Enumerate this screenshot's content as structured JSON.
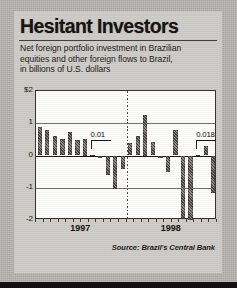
{
  "headline": "Hesitant Investors",
  "deck": [
    "Net foreign portfolio investment in Brazilian",
    "equities and other foreign flows to Brazil,",
    "in billions of U.S. dollars"
  ],
  "source": "Source: Brazil's Central Bank",
  "chart_data": {
    "type": "bar",
    "title": "Hesitant Investors",
    "subtitle": "Net foreign portfolio investment in Brazilian equities and other foreign flows to Brazil, in billions of U.S. dollars",
    "xlabel": "",
    "ylabel": "billions of U.S. dollars",
    "ylim": [
      -2,
      2
    ],
    "ytick_labels": [
      "$2",
      "1",
      "0",
      "-1",
      "-2"
    ],
    "ytick_values": [
      2,
      1,
      0,
      -1,
      -2
    ],
    "grid": true,
    "legend": false,
    "year_labels": [
      "1997",
      "1998"
    ],
    "categories": [
      "1997-01",
      "1997-02",
      "1997-03",
      "1997-04",
      "1997-05",
      "1997-06",
      "1997-07",
      "1997-08",
      "1997-09",
      "1997-10",
      "1997-11",
      "1997-12",
      "1998-01",
      "1998-02",
      "1998-03",
      "1998-04",
      "1998-05",
      "1998-06",
      "1998-07",
      "1998-08",
      "1998-09",
      "1998-10",
      "1998-11",
      "1998-12"
    ],
    "values": [
      0.88,
      0.78,
      0.6,
      0.52,
      0.73,
      0.48,
      0.5,
      0.01,
      -0.08,
      -0.6,
      -1.05,
      -0.42,
      0.38,
      0.62,
      1.25,
      0.42,
      -0.09,
      -0.52,
      0.8,
      -1.95,
      -2.1,
      0.018,
      0.3,
      -1.15
    ],
    "annotations": [
      {
        "label": "0.01",
        "value": 0.01,
        "index": 7
      },
      {
        "label": "0.018",
        "value": 0.018,
        "index": 21
      }
    ]
  }
}
